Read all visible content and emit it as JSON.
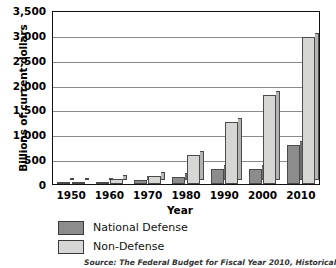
{
  "chart_data": {
    "type": "bar",
    "title": "",
    "xlabel": "Year",
    "ylabel": "Billions of current dollars",
    "categories": [
      "1950",
      "1960",
      "1970",
      "1980",
      "1990",
      "2000",
      "2010"
    ],
    "series": [
      {
        "name": "National Defense",
        "color": "#8c8c8c",
        "values": [
          14,
          48,
          82,
          134,
          299,
          294,
          794
        ]
      },
      {
        "name": "Non-Defense",
        "color": "#d6d6d4",
        "values": [
          29,
          92,
          154,
          577,
          1253,
          1795,
          2956
        ]
      }
    ],
    "ylim": [
      0,
      3500
    ],
    "yticks": [
      0,
      500,
      1000,
      1500,
      2000,
      2500,
      3000,
      3500
    ],
    "ytick_labels": [
      "0",
      "500",
      "1,000",
      "1,500",
      "2,000",
      "2,500",
      "3,000",
      "3,500"
    ],
    "grid": true,
    "legend_position": "below-axis-left",
    "source_note": "Source: The Federal Budget for Fiscal Year 2010, Historical Tables"
  },
  "legend": {
    "items": [
      {
        "label": "National Defense"
      },
      {
        "label": "Non-Defense"
      }
    ]
  }
}
